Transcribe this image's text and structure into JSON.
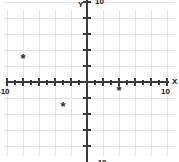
{
  "chart_data": {
    "type": "scatter",
    "title": "",
    "xlabel": "X",
    "ylabel": "Y",
    "xlim": [
      -11,
      11
    ],
    "ylim": [
      -11,
      11
    ],
    "grid": true,
    "grid_step": 2,
    "tick_step": 1,
    "major_tick_step": 2,
    "legend": "none",
    "marker": "*",
    "x_tick_labels": [
      {
        "value": -10,
        "label": "-10"
      },
      {
        "value": 10,
        "label": "10"
      }
    ],
    "y_tick_labels": [
      {
        "value": 10,
        "label": "10"
      },
      {
        "value": -10,
        "label": "-10"
      }
    ],
    "points": [
      {
        "x": -8,
        "y": 3,
        "marker": "*"
      },
      {
        "x": -3,
        "y": -3,
        "marker": "*"
      },
      {
        "x": 4,
        "y": -1,
        "marker": "*"
      }
    ],
    "colors": {
      "background": "#ffffff",
      "grid": "#e4e4e8",
      "axis": "#3a3a3a",
      "point": "#2a2a2a",
      "text": "#1a1a1a"
    }
  },
  "axes": {
    "x_axis_name": "X",
    "y_axis_name": "Y"
  },
  "geometry": {
    "origin_x": 87,
    "origin_y": 82,
    "unit_px": 8,
    "width": 179,
    "height": 162
  }
}
